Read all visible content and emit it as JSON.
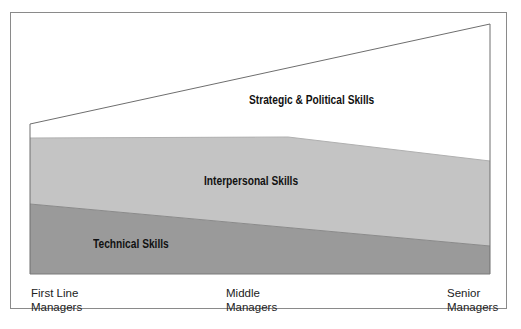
{
  "diagram": {
    "title": "",
    "bands": [
      {
        "name": "strategic",
        "label": "Strategic & Political Skills",
        "color": "#ffffff"
      },
      {
        "name": "interpersonal",
        "label": "Interpersonal Skills",
        "color": "#c4c4c4"
      },
      {
        "name": "technical",
        "label": "Technical Skills",
        "color": "#9a9a9a"
      }
    ],
    "levels": [
      {
        "line1": "First Line",
        "line2": "Managers"
      },
      {
        "line1": "Middle",
        "line2": "Managers"
      },
      {
        "line1": "Senior",
        "line2": "Managers"
      }
    ],
    "colors": {
      "frame": "#8a8a8a",
      "outline": "#6e6e6e",
      "light_band": "#c4c4c4",
      "dark_band": "#9a9a9a",
      "text": "#111111"
    }
  }
}
